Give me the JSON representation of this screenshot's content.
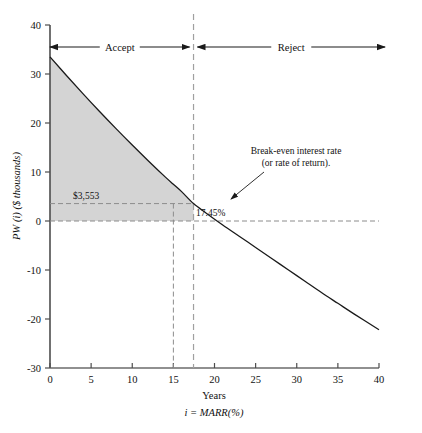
{
  "chart_data": {
    "type": "line",
    "title": "",
    "xlabel": "Years",
    "xlabel2": "i = MARR(%)",
    "ylabel": "PW (i) ($ thousands)",
    "xlim": [
      0,
      40
    ],
    "ylim": [
      -30,
      40
    ],
    "x_ticks": [
      0,
      5,
      10,
      15,
      20,
      25,
      30,
      35,
      40
    ],
    "x_tick_labels": [
      "0",
      "5",
      "10",
      "15",
      "20",
      "25",
      "30",
      "35",
      "40"
    ],
    "y_ticks": [
      40,
      30,
      20,
      10,
      0,
      -10,
      -20,
      -30
    ],
    "y_tick_labels": [
      "40",
      "30",
      "20",
      "10",
      "0",
      "-10",
      "-20",
      "-30"
    ],
    "grid": false,
    "legend": false,
    "series": [
      {
        "name": "PW(i)",
        "x": [
          0,
          2,
          4,
          6,
          8,
          10,
          12,
          14,
          15,
          16,
          17.45,
          19,
          21,
          23,
          25,
          27,
          29,
          31,
          33,
          35,
          37,
          40
        ],
        "y": [
          33.5,
          29.7,
          26.0,
          22.4,
          18.9,
          15.5,
          12.2,
          9.0,
          7.5,
          6.0,
          3.553,
          1.6,
          -0.8,
          -3.1,
          -5.4,
          -7.7,
          -10.0,
          -12.3,
          -14.6,
          -16.8,
          -19.0,
          -22.2
        ]
      }
    ],
    "zero_line": 0,
    "break_even_x": 17.45,
    "marr_x": 15,
    "pw_at_marr": 3.553,
    "shaded_region": {
      "from_x": 0,
      "to_x": 17.45,
      "label": "positive PW (Accept)"
    },
    "annotations": [
      {
        "name": "accept-region",
        "text": "Accept",
        "x_from": 0,
        "x_to": 17.45
      },
      {
        "name": "reject-region",
        "text": "Reject",
        "x_from": 17.45,
        "x_to": 40
      },
      {
        "name": "break-even-note-line1",
        "text": "Break-even interest rate"
      },
      {
        "name": "break-even-note-line2",
        "text": "(or rate of return)."
      },
      {
        "name": "break-even-value",
        "text": "17.45%"
      },
      {
        "name": "pw-value",
        "text": "$3,553"
      }
    ],
    "colors": {
      "curve": "#1a1a1a",
      "fill": "#d4d4d4",
      "axis": "#4d4d4d",
      "dashed": "#8c8c8c",
      "text": "#111111"
    }
  }
}
